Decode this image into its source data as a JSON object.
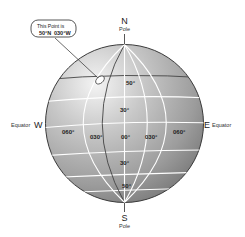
{
  "diagram": {
    "north": {
      "letter": "N",
      "sub": "Pole"
    },
    "south": {
      "letter": "S",
      "sub": "Pole"
    },
    "west": {
      "letter": "W",
      "sub": "Equator"
    },
    "east": {
      "letter": "E",
      "sub": "Equator"
    },
    "callout": {
      "line1": "This Point is",
      "lat": "50°N",
      "lon": "030°W"
    },
    "latitude_labels": [
      {
        "text": "50°",
        "position": "north"
      },
      {
        "text": "30°",
        "position": "north"
      },
      {
        "text": "30°",
        "position": "south"
      },
      {
        "text": "50°",
        "position": "south"
      }
    ],
    "longitude_labels": [
      {
        "text": "060°",
        "side": "west"
      },
      {
        "text": "030°",
        "side": "west"
      },
      {
        "text": "00°",
        "side": "center"
      },
      {
        "text": "030°",
        "side": "east"
      },
      {
        "text": "060°",
        "side": "east"
      }
    ],
    "colors": {
      "globe_light": "#f2f2f2",
      "globe_mid": "#b4b4b4",
      "globe_dark": "#7a7a7a",
      "grid": "#ffffff",
      "highlight_line": "#555555",
      "text": "#222222"
    }
  }
}
